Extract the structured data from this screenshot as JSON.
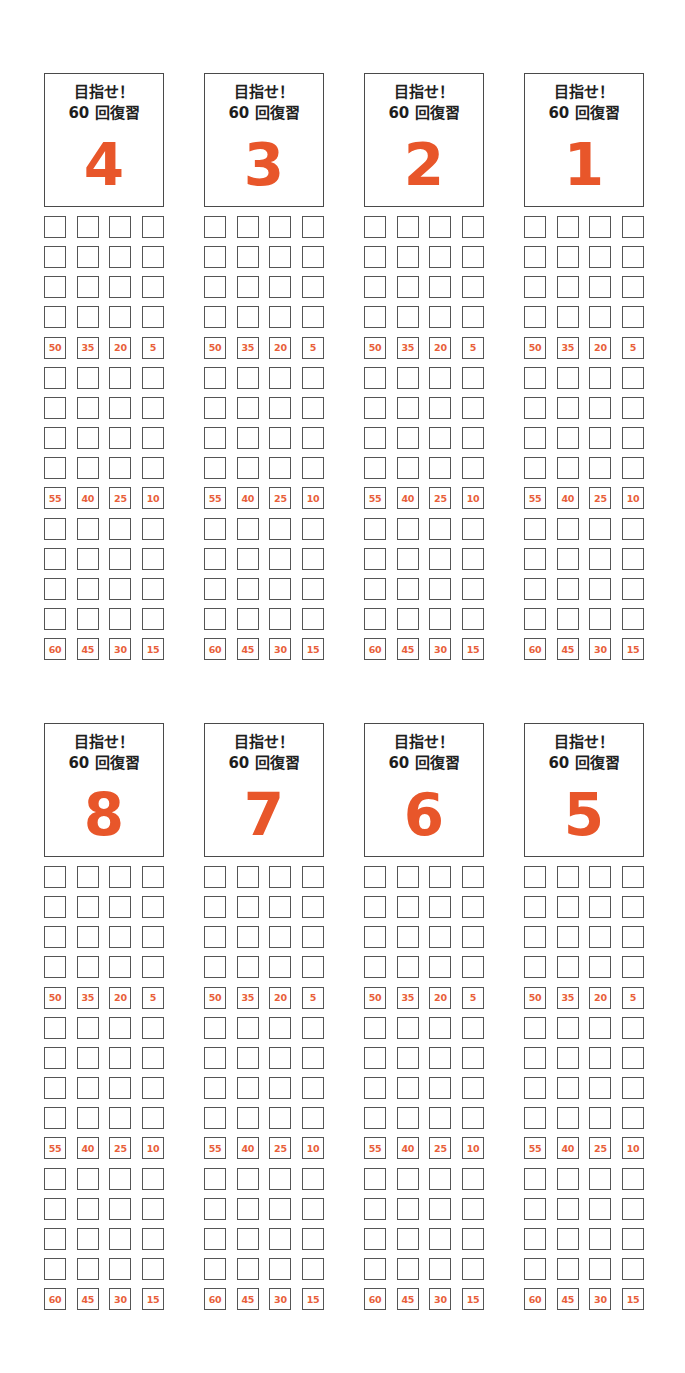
{
  "page": {
    "background": "#ffffff",
    "accent_color": "#e8562a",
    "label_color": "#e8603a",
    "border_color": "#555555"
  },
  "header_text": {
    "line1": "目指せ！",
    "line2": "60 回復習"
  },
  "cards": [
    {
      "number": "4",
      "left": 44,
      "top": 73
    },
    {
      "number": "3",
      "left": 204,
      "top": 73
    },
    {
      "number": "2",
      "left": 364,
      "top": 73
    },
    {
      "number": "1",
      "left": 524,
      "top": 73
    },
    {
      "number": "8",
      "left": 44,
      "top": 723
    },
    {
      "number": "7",
      "left": 204,
      "top": 723
    },
    {
      "number": "6",
      "left": 364,
      "top": 723
    },
    {
      "number": "5",
      "left": 524,
      "top": 723
    }
  ],
  "grid": {
    "rows": 15,
    "columns": 4,
    "labeled_rows": {
      "4": [
        "50",
        "35",
        "20",
        "5"
      ],
      "9": [
        "55",
        "40",
        "25",
        "10"
      ],
      "14": [
        "60",
        "45",
        "30",
        "15"
      ]
    }
  }
}
